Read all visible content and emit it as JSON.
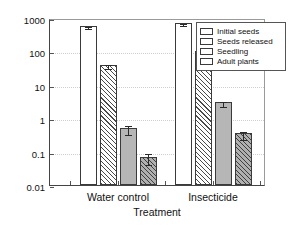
{
  "chart_data": {
    "type": "bar",
    "title": "",
    "xlabel": "Treatment",
    "ylabel": "Densities of plant stages",
    "yscale": "log",
    "ylim": [
      0.01,
      1000
    ],
    "ytick_labels": [
      "1000",
      "100",
      "10",
      "1",
      "0.1",
      "0.01"
    ],
    "ytick_values": [
      1000,
      100,
      10,
      1,
      0.1,
      0.01
    ],
    "grid": "horizontal-dotted",
    "legend_position": "top-right",
    "categories": [
      "Water control",
      "Insecticide"
    ],
    "series": [
      {
        "name": "Initial seeds",
        "fill": "white",
        "values": [
          580,
          700
        ],
        "errors": [
          40,
          45
        ]
      },
      {
        "name": "Seeds released",
        "fill": "diagonal-hatch-white",
        "values": [
          40,
          100
        ],
        "errors": [
          5,
          12
        ]
      },
      {
        "name": "Seedling",
        "fill": "solid-gray",
        "values": [
          0.5,
          3.0
        ],
        "errors": [
          0.15,
          0.5
        ]
      },
      {
        "name": "Adult plants",
        "fill": "diagonal-hatch-gray",
        "values": [
          0.07,
          0.35
        ],
        "errors": [
          0.025,
          0.09
        ]
      }
    ]
  },
  "legend": {
    "items": [
      {
        "label": "Initial seeds"
      },
      {
        "label": "Seeds released"
      },
      {
        "label": "Seedling"
      },
      {
        "label": "Adult plants"
      }
    ]
  },
  "axes": {
    "y_title": "Densities of plant stages",
    "x_title": "Treatment"
  }
}
